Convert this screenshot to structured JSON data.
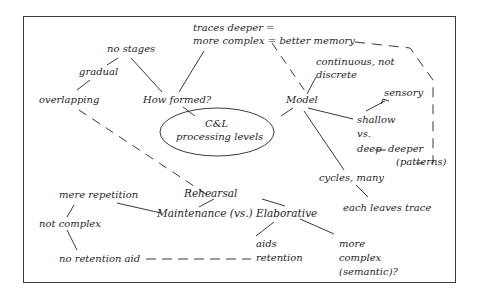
{
  "diagram": {
    "colors": {
      "ink": "#1e1e1e",
      "line": "#3a3a3a",
      "background": "#ffffff"
    },
    "center": {
      "line1": "C&L",
      "line2": "processing levels"
    },
    "nodes": {
      "no_stages": "no stages",
      "gradual": "gradual",
      "overlapping": "overlapping",
      "how_formed": "How formed?",
      "traces_1": "traces deeper =",
      "traces_2": "more complex = better memory",
      "model": "Model",
      "continuous_1": "continuous, not",
      "continuous_2": "discrete",
      "sensory": "sensory",
      "shallow": "shallow",
      "vs": "vs.",
      "deep": "deep",
      "deeper": "deeper",
      "patterns": "(patterns)",
      "cycles": "cycles, many",
      "each_leaves": "each leaves trace",
      "rehearsal": "Rehearsal",
      "maint_elab": "Maintenance (vs.) Elaborative",
      "mere_repetition": "mere repetition",
      "not_complex": "not complex",
      "no_retention": "no retention aid",
      "aids_1": "aids",
      "aids_2": "retention",
      "more_1": "more",
      "more_2": "complex",
      "more_3": "(semantic)?"
    }
  }
}
